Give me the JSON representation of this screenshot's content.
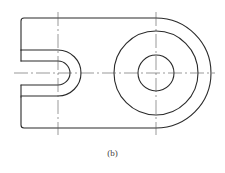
{
  "figure": {
    "caption": "(b)",
    "type": "engineering drawing - top view of a slotted link with boss",
    "colors": {
      "outline": "#2a2a2a",
      "centerline": "#555555",
      "background": "#ffffff"
    }
  },
  "geometry": {
    "outline": {
      "left": 21,
      "top": 18,
      "bottom": 127,
      "corner_radius": 3
    },
    "boss": {
      "cx": 156,
      "cy": 73,
      "outer_radius": 55,
      "middle_radius": 42,
      "inner_radius": 18
    },
    "slot": {
      "center_x": 58,
      "cy": 73,
      "outer_half_height": 23,
      "inner_half_height": 12
    },
    "centerlines": {
      "horizontal": {
        "y": 73,
        "x1": 14,
        "x2": 215
      },
      "vertical_left": {
        "x": 58,
        "y1": 12,
        "y2": 135
      },
      "vertical_right": {
        "x": 156,
        "y1": 12,
        "y2": 135
      }
    }
  }
}
